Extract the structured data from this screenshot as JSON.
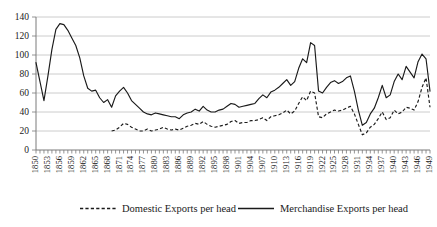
{
  "chart_data": {
    "type": "line",
    "title": "",
    "subtitle": "",
    "xlabel": "",
    "ylabel": "",
    "ylim": [
      0,
      140
    ],
    "ytick_values": [
      0,
      20,
      40,
      60,
      80,
      100,
      120,
      140
    ],
    "ytick_labels": [
      "0",
      "20",
      "40",
      "60",
      "80",
      "100",
      "120",
      "140"
    ],
    "grid": "horizontal",
    "legend_position": "bottom",
    "xlim": [
      1850,
      1949
    ],
    "x_tick_step": 3,
    "xtick_labels": [
      "1850",
      "1853",
      "1856",
      "1859",
      "1862",
      "1865",
      "1868",
      "1871",
      "1874",
      "1877",
      "1880",
      "1883",
      "1886",
      "1889",
      "1892",
      "1895",
      "1898",
      "1901",
      "1904",
      "1907",
      "1910",
      "1913",
      "1916",
      "1919",
      "1922",
      "1925",
      "1928",
      "1931",
      "1934",
      "1937",
      "1940",
      "1943",
      "1946",
      "1949"
    ],
    "x": [
      1850,
      1851,
      1852,
      1853,
      1854,
      1855,
      1856,
      1857,
      1858,
      1859,
      1860,
      1861,
      1862,
      1863,
      1864,
      1865,
      1866,
      1867,
      1868,
      1869,
      1870,
      1871,
      1872,
      1873,
      1874,
      1875,
      1876,
      1877,
      1878,
      1879,
      1880,
      1881,
      1882,
      1883,
      1884,
      1885,
      1886,
      1887,
      1888,
      1889,
      1890,
      1891,
      1892,
      1893,
      1894,
      1895,
      1896,
      1897,
      1898,
      1899,
      1900,
      1901,
      1902,
      1903,
      1904,
      1905,
      1906,
      1907,
      1908,
      1909,
      1910,
      1911,
      1912,
      1913,
      1914,
      1915,
      1916,
      1917,
      1918,
      1919,
      1920,
      1921,
      1922,
      1923,
      1924,
      1925,
      1926,
      1927,
      1928,
      1929,
      1930,
      1931,
      1932,
      1933,
      1934,
      1935,
      1936,
      1937,
      1938,
      1939,
      1940,
      1941,
      1942,
      1943,
      1944,
      1945,
      1946,
      1947,
      1948,
      1949
    ],
    "series": [
      {
        "name": "Merchandise Exports per head",
        "style": "solid",
        "values": [
          92,
          72,
          52,
          78,
          106,
          127,
          133,
          132,
          126,
          118,
          110,
          97,
          78,
          65,
          62,
          63,
          55,
          50,
          53,
          45,
          57,
          62,
          66,
          60,
          52,
          48,
          44,
          40,
          38,
          37,
          39,
          38,
          37,
          36,
          35,
          35,
          33,
          37,
          39,
          40,
          43,
          41,
          46,
          42,
          40,
          40,
          42,
          43,
          46,
          49,
          48,
          45,
          46,
          47,
          48,
          49,
          54,
          58,
          55,
          61,
          63,
          66,
          70,
          74,
          68,
          72,
          86,
          96,
          92,
          113,
          110,
          62,
          60,
          66,
          71,
          73,
          70,
          72,
          76,
          78,
          62,
          42,
          26,
          29,
          38,
          44,
          55,
          68,
          55,
          58,
          72,
          80,
          74,
          88,
          82,
          76,
          93,
          101,
          96,
          62
        ]
      },
      {
        "name": "Domestic Exports per head",
        "style": "dashed",
        "start_year": 1869,
        "values": [
          null,
          null,
          null,
          null,
          null,
          null,
          null,
          null,
          null,
          null,
          null,
          null,
          null,
          null,
          null,
          null,
          null,
          null,
          null,
          20,
          21,
          24,
          28,
          27,
          24,
          22,
          20,
          20,
          22,
          20,
          21,
          22,
          24,
          22,
          21,
          22,
          21,
          23,
          25,
          26,
          28,
          27,
          30,
          27,
          25,
          24,
          25,
          26,
          27,
          30,
          31,
          28,
          29,
          29,
          31,
          31,
          32,
          34,
          31,
          35,
          36,
          37,
          39,
          42,
          38,
          41,
          49,
          56,
          52,
          62,
          60,
          35,
          34,
          38,
          40,
          42,
          41,
          42,
          44,
          46,
          38,
          27,
          16,
          18,
          24,
          27,
          33,
          40,
          32,
          34,
          42,
          38,
          40,
          45,
          44,
          42,
          51,
          66,
          76,
          45
        ]
      }
    ]
  },
  "legend": {
    "items": [
      {
        "label": "Domestic Exports per head",
        "style": "dashed"
      },
      {
        "label": "Merchandise Exports per head",
        "style": "solid"
      }
    ]
  }
}
